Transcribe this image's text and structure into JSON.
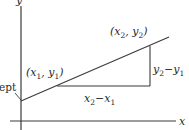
{
  "diagram": {
    "type": "slope-of-line",
    "axes": {
      "x_label": "x",
      "y_label": "y"
    },
    "points": {
      "p1": {
        "label": "(x₁, y₁)",
        "x_sub": "1",
        "y_sub": "1"
      },
      "p2": {
        "label": "(x₂, y₂)",
        "x_sub": "2",
        "y_sub": "2"
      }
    },
    "run_label": "x₂−x₁",
    "rise_label": "y₂−y₁",
    "intercept_label": "ept",
    "colors": {
      "line": "#3a3a3a",
      "background": "#ffffff"
    }
  }
}
